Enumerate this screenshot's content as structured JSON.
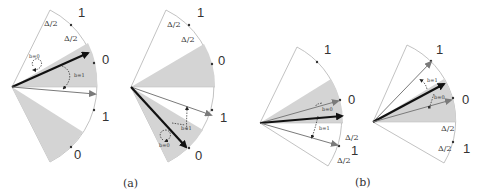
{
  "figure": {
    "colors": {
      "shade": "#d4d4d4",
      "outline": "#b0b0b0",
      "arrow_dark": "#111111",
      "arrow_gray": "#808080",
      "dot": "#333333"
    },
    "panels": [
      {
        "id": "a1",
        "group": "a",
        "labels": {
          "top_1": "1",
          "delta_outer": "Δ/2",
          "delta_inner": "Δ/2",
          "mid_0": "0",
          "mid_1": "1",
          "bot_0": "0"
        },
        "annotations": {
          "b0": "b=0",
          "b1": "b=1"
        }
      },
      {
        "id": "a2",
        "group": "a",
        "labels": {
          "top_1": "1",
          "delta_outer": "Δ/2",
          "delta_inner": "Δ/2",
          "mid_0": "0",
          "mid_1": "1",
          "bot_0": "0"
        },
        "annotations": {
          "b1": "b=1",
          "b0": "b=0"
        }
      },
      {
        "id": "b1",
        "group": "b",
        "labels": {
          "top_1": "1",
          "mid_0": "0",
          "delta_upper": "Δ/2",
          "bot_1": "1",
          "delta_lower": "Δ/2"
        },
        "annotations": {
          "b0": "b=0",
          "b1": "b=1"
        }
      },
      {
        "id": "b2",
        "group": "b",
        "labels": {
          "top_1": "1",
          "mid_0": "0",
          "delta_upper": "Δ/2",
          "delta_lower": "Δ/2",
          "bot_1": "1"
        },
        "annotations": {
          "b1": "b=1",
          "b0": "b=0"
        }
      }
    ],
    "captions": {
      "a": "(a)",
      "b": "(b)"
    }
  }
}
